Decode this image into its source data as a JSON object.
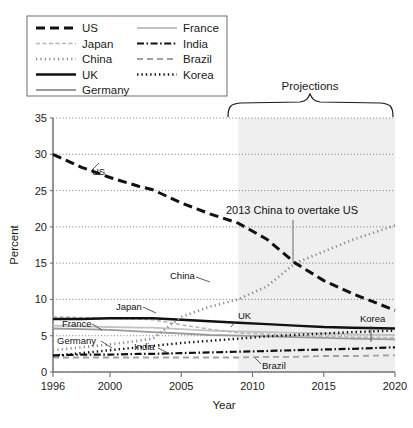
{
  "legend": {
    "position": "top-left",
    "box_border": "#6e6e6e",
    "items": [
      {
        "label": "US",
        "style": "thick-dashed",
        "color": "#111111",
        "col": 0
      },
      {
        "label": "Japan",
        "style": "light-dashed",
        "color": "#b6b6b6",
        "col": 0
      },
      {
        "label": "China",
        "style": "dotted",
        "color": "#8a8a8a",
        "col": 0
      },
      {
        "label": "UK",
        "style": "thick-solid",
        "color": "#111111",
        "col": 0
      },
      {
        "label": "Germany",
        "style": "solid",
        "color": "#9a9a9a",
        "col": 0
      },
      {
        "label": "France",
        "style": "solid-light",
        "color": "#c2c2c2",
        "col": 1
      },
      {
        "label": "India",
        "style": "dash-dot",
        "color": "#111111",
        "col": 1
      },
      {
        "label": "Brazil",
        "style": "dashed-gray",
        "color": "#a0a0a0",
        "col": 1
      },
      {
        "label": "Korea",
        "style": "thick-dotted",
        "color": "#111111",
        "col": 1
      }
    ]
  },
  "annotations": {
    "projections_label": "Projections",
    "overtake_label": "2013 China to overtake US",
    "inline_labels": [
      {
        "text": "US",
        "x": 92,
        "y": 175
      },
      {
        "text": "China",
        "x": 170,
        "y": 279
      },
      {
        "text": "Japan",
        "x": 116,
        "y": 310
      },
      {
        "text": "UK",
        "x": 238,
        "y": 319
      },
      {
        "text": "Korea",
        "x": 360,
        "y": 322
      },
      {
        "text": "France",
        "x": 62,
        "y": 327
      },
      {
        "text": "Germany",
        "x": 57,
        "y": 344
      },
      {
        "text": "India",
        "x": 134,
        "y": 350
      },
      {
        "text": "Brazil",
        "x": 262,
        "y": 369
      }
    ]
  },
  "chart_data": {
    "type": "line",
    "title": "",
    "xlabel": "Year",
    "ylabel": "Percent",
    "xlim": [
      1996,
      2020
    ],
    "ylim": [
      0,
      35
    ],
    "ytick_values": [
      0,
      5,
      10,
      15,
      20,
      25,
      30,
      35
    ],
    "xtick_values": [
      1996,
      2000,
      2005,
      2010,
      2015,
      2020
    ],
    "xtick_labels": [
      "1996",
      "2000",
      "2005",
      "2010",
      "2015",
      "2020"
    ],
    "grid": "horizontal-dotted",
    "legend_position": "above-plot-left",
    "projection_start": 2009,
    "projection_shading": "#efefef",
    "crossing": {
      "year": 2013,
      "value": 15.0,
      "note": "2013 China to overtake US"
    },
    "x": [
      1996,
      1998,
      2000,
      2002,
      2003,
      2005,
      2007,
      2009,
      2011,
      2013,
      2015,
      2017,
      2020
    ],
    "series": [
      {
        "name": "US",
        "values": [
          30.0,
          28.2,
          26.8,
          25.6,
          25.1,
          23.3,
          21.8,
          20.5,
          18.3,
          15.0,
          12.6,
          10.8,
          8.5
        ]
      },
      {
        "name": "China",
        "values": [
          3.0,
          3.4,
          3.8,
          4.3,
          4.6,
          7.6,
          9.0,
          10.0,
          11.8,
          15.0,
          16.6,
          18.2,
          20.2
        ]
      },
      {
        "name": "Japan",
        "values": [
          7.6,
          7.5,
          7.4,
          7.3,
          7.2,
          6.5,
          5.9,
          5.4,
          5.2,
          5.0,
          4.9,
          4.8,
          4.7
        ]
      },
      {
        "name": "UK",
        "values": [
          7.3,
          7.3,
          7.4,
          7.4,
          7.4,
          7.2,
          7.0,
          6.8,
          6.6,
          6.4,
          6.2,
          6.1,
          6.0
        ]
      },
      {
        "name": "Germany",
        "values": [
          6.0,
          5.9,
          5.8,
          5.6,
          5.5,
          5.3,
          5.1,
          5.0,
          4.9,
          4.8,
          4.7,
          4.6,
          4.5
        ]
      },
      {
        "name": "France",
        "values": [
          6.4,
          6.3,
          6.2,
          6.1,
          6.1,
          5.9,
          5.7,
          5.6,
          5.5,
          5.4,
          5.3,
          5.2,
          5.1
        ]
      },
      {
        "name": "Korea",
        "values": [
          2.2,
          2.6,
          3.0,
          3.4,
          3.6,
          4.0,
          4.3,
          4.6,
          4.9,
          5.1,
          5.3,
          5.5,
          5.7
        ]
      },
      {
        "name": "India",
        "values": [
          2.3,
          2.4,
          2.4,
          2.5,
          2.5,
          2.6,
          2.7,
          2.8,
          2.9,
          3.0,
          3.1,
          3.2,
          3.4
        ]
      },
      {
        "name": "Brazil",
        "values": [
          2.0,
          2.0,
          2.0,
          2.0,
          2.0,
          2.0,
          2.0,
          2.0,
          2.1,
          2.1,
          2.2,
          2.2,
          2.3
        ]
      }
    ]
  }
}
